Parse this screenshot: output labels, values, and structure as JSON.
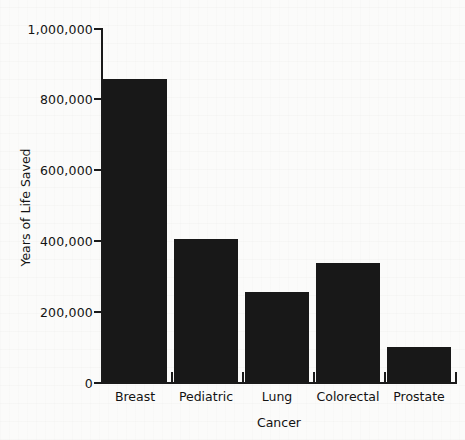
{
  "chart_data": {
    "type": "bar",
    "title": "",
    "subtitle": "",
    "xlabel": "Cancer",
    "ylabel": "Years of Life Saved",
    "categories": [
      "Breast",
      "Pediatric",
      "Lung",
      "Colorectal",
      "Prostate"
    ],
    "values": [
      855000,
      405000,
      255000,
      335000,
      100000
    ],
    "series": [
      {
        "name": "Years of Life Saved",
        "values": [
          855000,
          405000,
          255000,
          335000,
          100000
        ]
      }
    ],
    "ylim": [
      0,
      1000000
    ],
    "ytick_values": [
      0,
      200000,
      400000,
      600000,
      800000,
      1000000
    ],
    "ytick_labels": [
      "0",
      "200,000",
      "400,000",
      "600,000",
      "800,000",
      "1,000,000"
    ],
    "grid": false,
    "legend": false,
    "legend_position": "none",
    "bar_color": "#181818",
    "axis_color": "#1a1a1a",
    "background_color": "#fbfbfa"
  }
}
